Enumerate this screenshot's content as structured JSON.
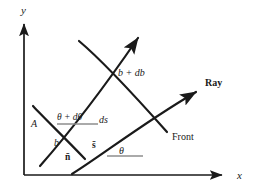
{
  "figure": {
    "background_color": "#ffffff",
    "ink_color": "#1a1a1a",
    "guide_color": "#8a8a8a",
    "axes": {
      "x_label": "x",
      "y_label": "y",
      "origin": [
        24,
        175
      ],
      "x_end": [
        228,
        175
      ],
      "y_end": [
        24,
        18
      ]
    },
    "labels": {
      "point_a": "A",
      "b": "b",
      "b_plus_db": "b + db",
      "theta": "θ",
      "theta_plus_dtheta": "θ + dθ",
      "ds": "ds",
      "n_bar": "n̄",
      "s_bar": "s̄",
      "ray": "Ray",
      "front": "Front"
    },
    "curves": {
      "ray_upper": "upper ray arrow from lower-left to upper-right",
      "ray_lower": "lower ray arrow from A region to right, labeled Ray",
      "front_left": "left wavefront curve through A",
      "front_right": "right wavefront curve, labeled Front"
    }
  }
}
